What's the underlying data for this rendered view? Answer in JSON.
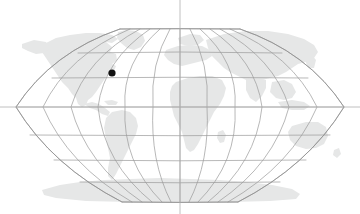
{
  "figure": {
    "name": "world-map-locator",
    "type": "map",
    "projection": "robinson",
    "width": 360,
    "height": 214
  },
  "colors": {
    "background": "#ffffff",
    "land_fill": "#e6e7e7",
    "graticule_stroke": "#9a9a9a",
    "outline_stroke": "#8f8f8f",
    "crosshair_stroke": "#b0b0b0",
    "marker_fill": "#111111"
  },
  "strokes": {
    "graticule_width": 0.7,
    "outline_width": 0.8,
    "crosshair_width": 0.8
  },
  "map_frame": {
    "left": 16,
    "right": 344,
    "top": 29,
    "bottom": 202,
    "center_x": 180,
    "center_y": 115.5
  },
  "graticule": {
    "meridian_interval_degrees": 30,
    "parallel_interval_degrees": 30,
    "meridian_x_at_equator": [
      16,
      43.3,
      70.7,
      98,
      125.3,
      152.7,
      180,
      207.3,
      234.7,
      262,
      289.3,
      316.7,
      344
    ],
    "parallel_y": [
      29,
      53,
      78,
      107,
      135,
      160,
      182,
      202
    ],
    "parallel_labels": [
      "90N",
      "60N",
      "45N",
      "15N",
      "15S",
      "45S",
      "60S",
      "90S"
    ],
    "equator_y": 107,
    "prime_meridian_x": 180
  },
  "crosshair": {
    "horizontal_y": 107,
    "vertical_x": 180,
    "extends_to_image_edges": true
  },
  "marker": {
    "label": "location-marker",
    "x": 112,
    "y": 73,
    "radius": 3.6,
    "shape": "circle"
  },
  "landmasses": [
    "north-america",
    "south-america",
    "europe",
    "africa",
    "asia",
    "australia",
    "antarctica",
    "greenland"
  ]
}
